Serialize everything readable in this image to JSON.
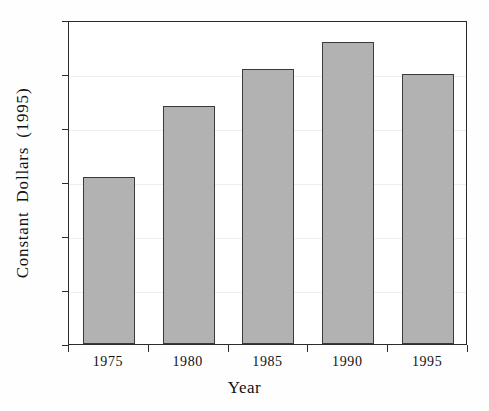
{
  "chart_data": {
    "type": "bar",
    "title": "",
    "subtitle": "",
    "xlabel": "Year",
    "ylabel": "Constant  Dollars  (1995)",
    "categories": [
      "1975",
      "1980",
      "1985",
      "1990",
      "1995"
    ],
    "values": [
      3.1,
      4.4,
      5.1,
      5.6,
      5.0
    ],
    "series": [
      {
        "name": "Constant Dollars (1995)",
        "values": [
          3.1,
          4.4,
          5.1,
          5.6,
          5.0
        ]
      }
    ],
    "ylim": [
      0,
      6
    ],
    "yticks": [
      0,
      1,
      2,
      3,
      4,
      5,
      6
    ],
    "ytick_labels": [
      "0",
      "1",
      "2",
      "3",
      "4",
      "5",
      "6"
    ],
    "xtick_labels": [
      "1975",
      "1980",
      "1985",
      "1990",
      "1995"
    ],
    "grid": true,
    "grid_axis": "y",
    "legend": false,
    "legend_position": "none",
    "bar_color": "#b2b2b2",
    "bar_edge_color": "#3a3a3a",
    "axis_color": "#2b2b2b",
    "grid_color": "#eeeeee",
    "background_color": "#fefefe"
  }
}
